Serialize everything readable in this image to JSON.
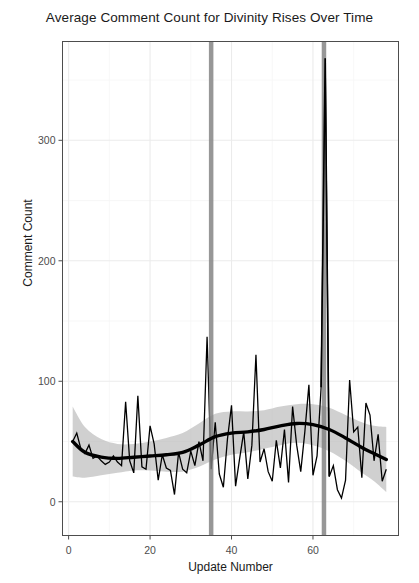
{
  "chart_data": {
    "type": "line",
    "title": "Average Comment Count for Divinity Rises Over Time",
    "xlabel": "Update Number",
    "ylabel": "Comment Count",
    "xlim": [
      -1.5,
      81
    ],
    "ylim": [
      -28,
      382
    ],
    "grid": true,
    "legend": "none",
    "background": "#ffffff",
    "panel_border_color": "#4d4d4d",
    "grid_major_color": "#ebebeb",
    "grid_minor_color": "#f5f5f5",
    "x_ticks": [
      0,
      20,
      40,
      60
    ],
    "x_tick_labels": [
      "0",
      "20",
      "40",
      "60"
    ],
    "y_ticks": [
      0,
      100,
      200,
      300
    ],
    "y_tick_labels": [
      "0",
      "100",
      "200",
      "300"
    ],
    "x_minor_ticks": [
      10,
      30,
      50,
      70
    ],
    "y_minor_ticks": [
      50,
      150,
      250,
      350
    ],
    "series": [
      {
        "name": "raw-comment-count",
        "type": "line",
        "color": "#000000",
        "width": 1.3,
        "x": [
          1,
          2,
          3,
          4,
          5,
          6,
          7,
          8,
          9,
          10,
          11,
          12,
          13,
          14,
          15,
          16,
          17,
          18,
          19,
          20,
          21,
          22,
          23,
          24,
          25,
          26,
          27,
          28,
          29,
          30,
          31,
          32,
          33,
          34,
          35,
          36,
          37,
          38,
          39,
          40,
          41,
          42,
          43,
          44,
          45,
          46,
          47,
          48,
          49,
          50,
          51,
          52,
          53,
          54,
          55,
          56,
          57,
          58,
          59,
          60,
          61,
          62,
          63,
          64,
          65,
          66,
          67,
          68,
          69,
          70,
          71,
          72,
          73,
          74,
          75,
          76,
          77,
          78
        ],
        "values": [
          50,
          57,
          44,
          40,
          47,
          36,
          38,
          34,
          31,
          33,
          38,
          33,
          30,
          83,
          34,
          24,
          88,
          29,
          27,
          63,
          48,
          18,
          39,
          28,
          26,
          6,
          41,
          27,
          24,
          42,
          30,
          50,
          34,
          137,
          27,
          66,
          23,
          12,
          52,
          80,
          13,
          36,
          58,
          19,
          47,
          122,
          33,
          44,
          25,
          17,
          51,
          28,
          60,
          16,
          79,
          47,
          25,
          58,
          97,
          22,
          38,
          95,
          368,
          21,
          30,
          10,
          3,
          18,
          101,
          58,
          62,
          20,
          82,
          72,
          34,
          56,
          17,
          27
        ]
      },
      {
        "name": "loess-trend",
        "type": "line",
        "color": "#000000",
        "width": 3.4,
        "x": [
          1,
          4,
          8,
          12,
          16,
          20,
          24,
          28,
          32,
          36,
          40,
          44,
          48,
          52,
          56,
          60,
          64,
          68,
          72,
          75,
          78
        ],
        "values": [
          50,
          41,
          37,
          36,
          37,
          38,
          39,
          41,
          47,
          54,
          57,
          58,
          60,
          63,
          65,
          64,
          60,
          53,
          45,
          40,
          35
        ]
      }
    ],
    "ribbon": {
      "name": "loess-confidence-band",
      "color": "#b3b3b3",
      "opacity": 0.62,
      "x": [
        1,
        4,
        8,
        12,
        16,
        20,
        24,
        28,
        32,
        36,
        40,
        44,
        48,
        52,
        56,
        60,
        64,
        68,
        72,
        75,
        78
      ],
      "upper": [
        79,
        62,
        52,
        48,
        48,
        50,
        53,
        57,
        65,
        73,
        75,
        75,
        76,
        79,
        81,
        81,
        78,
        72,
        66,
        63,
        62
      ],
      "lower": [
        21,
        20,
        22,
        24,
        26,
        26,
        25,
        25,
        29,
        35,
        39,
        41,
        44,
        47,
        49,
        47,
        42,
        34,
        24,
        17,
        8
      ]
    },
    "vlines": [
      {
        "name": "event-marker-1",
        "x": 35.0,
        "color": "#808080",
        "width_px": 4.5,
        "opacity": 0.82
      },
      {
        "name": "event-marker-2",
        "x": 62.7,
        "color": "#808080",
        "width_px": 4.5,
        "opacity": 0.82
      }
    ]
  }
}
